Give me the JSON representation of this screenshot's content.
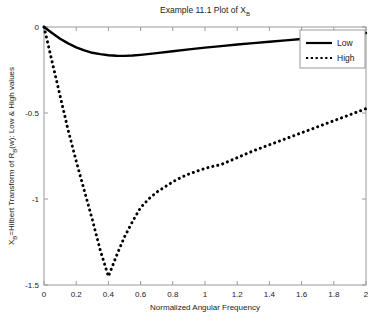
{
  "chart_data": {
    "type": "line",
    "title": "Example 11.1 Plot of X",
    "title_sub": "B",
    "xlabel": "Normalized Angular Frequency",
    "ylabel_pre": "X",
    "ylabel_sub1": "B",
    "ylabel_mid": "=Hilbert Transform of R",
    "ylabel_sub2": "B",
    "ylabel_post": "(w): Low & High values",
    "xlim": [
      0,
      2
    ],
    "ylim": [
      -1.5,
      0
    ],
    "xticks": [
      0,
      0.2,
      0.4,
      0.6,
      0.8,
      1,
      1.2,
      1.4,
      1.6,
      1.8,
      2
    ],
    "xticklabels": [
      "0",
      "0.2",
      "0.4",
      "0.6",
      "0.8",
      "1",
      "1.2",
      "1.4",
      "1.6",
      "1.8",
      "2"
    ],
    "yticks": [
      0,
      -0.5,
      -1,
      -1.5
    ],
    "yticklabels": [
      "0",
      "-0.5",
      "-1",
      "-1.5"
    ],
    "grid": false,
    "legend_position": "upper right",
    "axis_color": "#808080",
    "line_color": "#000000",
    "series": [
      {
        "name": "Low",
        "style": "solid",
        "x": [
          0,
          0.05,
          0.1,
          0.15,
          0.2,
          0.25,
          0.3,
          0.35,
          0.4,
          0.45,
          0.5,
          0.55,
          0.6,
          0.7,
          0.8,
          0.9,
          1.0,
          1.1,
          1.2,
          1.3,
          1.4,
          1.5,
          1.6,
          1.7,
          1.8,
          1.9,
          2.0
        ],
        "y": [
          0,
          -0.035,
          -0.068,
          -0.095,
          -0.118,
          -0.136,
          -0.15,
          -0.158,
          -0.164,
          -0.167,
          -0.168,
          -0.166,
          -0.162,
          -0.152,
          -0.141,
          -0.13,
          -0.12,
          -0.111,
          -0.102,
          -0.094,
          -0.086,
          -0.078,
          -0.07,
          -0.062,
          -0.053,
          -0.044,
          -0.035
        ]
      },
      {
        "name": "High",
        "style": "dotted",
        "x": [
          0,
          0.05,
          0.1,
          0.15,
          0.2,
          0.25,
          0.3,
          0.35,
          0.4,
          0.45,
          0.5,
          0.55,
          0.6,
          0.65,
          0.7,
          0.75,
          0.8,
          0.85,
          0.9,
          0.95,
          1.0,
          1.05,
          1.1,
          1.2,
          1.3,
          1.4,
          1.5,
          1.6,
          1.7,
          1.8,
          1.9,
          2.0
        ],
        "y": [
          0,
          -0.2,
          -0.4,
          -0.6,
          -0.78,
          -0.95,
          -1.12,
          -1.3,
          -1.45,
          -1.33,
          -1.22,
          -1.13,
          -1.05,
          -1.0,
          -0.96,
          -0.93,
          -0.9,
          -0.875,
          -0.855,
          -0.838,
          -0.822,
          -0.81,
          -0.8,
          -0.76,
          -0.72,
          -0.685,
          -0.65,
          -0.615,
          -0.58,
          -0.545,
          -0.51,
          -0.475
        ]
      }
    ],
    "legend_entries": [
      {
        "label": "Low",
        "style": "solid"
      },
      {
        "label": "High",
        "style": "dotted"
      }
    ]
  }
}
